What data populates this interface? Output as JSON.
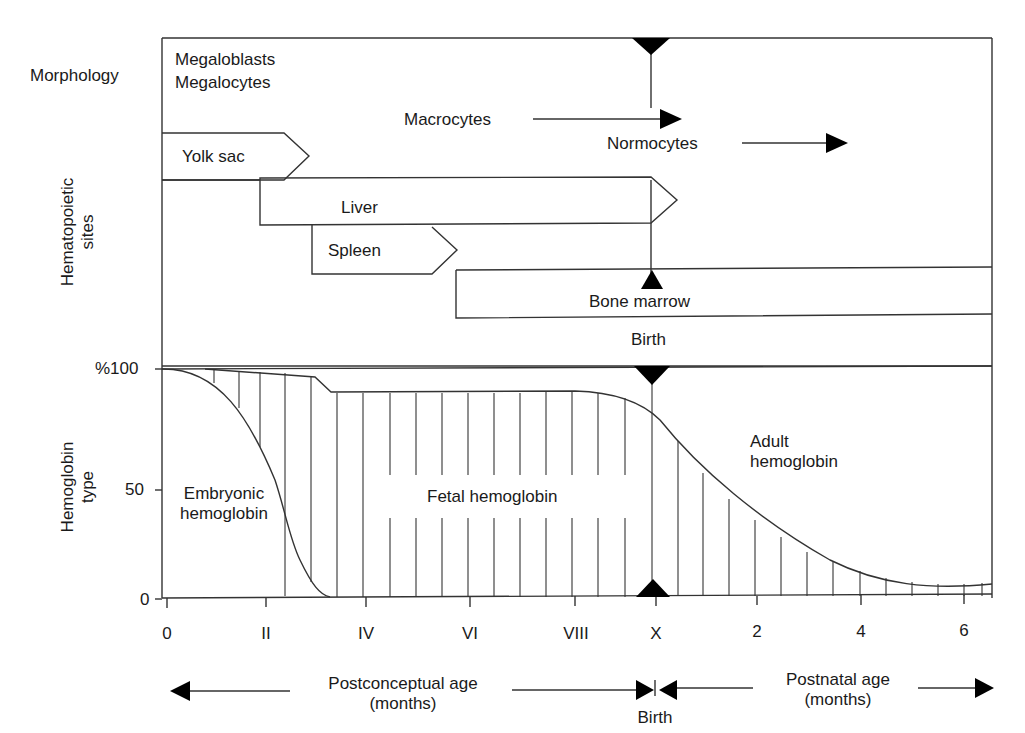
{
  "rows": {
    "morphology": "Morphology",
    "hematopoietic_sites": [
      "Hematopoietic",
      "sites"
    ],
    "hemoglobin_type": [
      "Hemoglobin",
      "type"
    ]
  },
  "morphology": {
    "megaloblasts": "Megaloblasts",
    "megalocytes": "Megalocytes",
    "macrocytes": "Macrocytes",
    "normocytes": "Normocytes"
  },
  "sites": {
    "yolk_sac": "Yolk sac",
    "liver": "Liver",
    "spleen": "Spleen",
    "bone_marrow": "Bone marrow",
    "birth": "Birth"
  },
  "hemoglobin": {
    "embryonic": [
      "Embryonic",
      "hemoglobin"
    ],
    "fetal": "Fetal hemoglobin",
    "adult": [
      "Adult",
      "hemoglobin"
    ]
  },
  "y_axis": {
    "ticks": [
      "%100",
      "50",
      "0"
    ]
  },
  "x_axis": {
    "ticks": [
      "0",
      "II",
      "IV",
      "VI",
      "VIII",
      "X",
      "2",
      "4",
      "6"
    ],
    "postconceptual": [
      "Postconceptual age",
      "(months)"
    ],
    "postnatal": [
      "Postnatal age",
      "(months)"
    ],
    "birth": "Birth"
  },
  "colors": {
    "line": "#333333",
    "fill": "#000000",
    "background": "#ffffff"
  }
}
